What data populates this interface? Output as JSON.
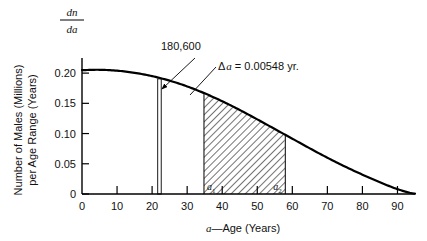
{
  "figure": {
    "background_color": "#ffffff",
    "line_color": "#000000"
  },
  "chart_data": {
    "type": "line",
    "title": "",
    "subtitle": "",
    "xlabel": "a—Age (Years)",
    "ylabel": "Number of Males (Millions) per Age Range (Years)",
    "y_axis_symbol_numerator": "dn",
    "y_axis_symbol_denominator": "da",
    "xlim": [
      0,
      95
    ],
    "ylim": [
      0,
      0.225
    ],
    "xticks": [
      0,
      10,
      20,
      30,
      40,
      50,
      60,
      70,
      80,
      90
    ],
    "xticklabels": [
      "0",
      "10",
      "20",
      "30",
      "40",
      "50",
      "60",
      "70",
      "80",
      "90"
    ],
    "yticks": [
      0,
      0.05,
      0.1,
      0.15,
      0.2
    ],
    "yticklabels": [
      "0",
      "0.05",
      "0.10",
      "0.15",
      "0.20"
    ],
    "grid": false,
    "legend": false,
    "series": [
      {
        "name": "dn/da",
        "x": [
          0,
          5,
          10,
          15,
          20,
          25,
          30,
          35,
          40,
          45,
          50,
          55,
          60,
          65,
          70,
          75,
          80,
          85,
          90,
          95
        ],
        "values": [
          0.205,
          0.2055,
          0.204,
          0.2005,
          0.195,
          0.1875,
          0.178,
          0.1665,
          0.1535,
          0.139,
          0.1235,
          0.1075,
          0.0915,
          0.0755,
          0.06,
          0.0455,
          0.032,
          0.0195,
          0.008,
          0.0005
        ]
      }
    ],
    "annotations": [
      {
        "name": "population-count",
        "text": "180,600",
        "x_data": 22,
        "note": "label for the narrow vertical strip"
      },
      {
        "name": "delta-a",
        "text_delta": "Δ",
        "text_var": "a",
        "text_rest": "= 0.00548 yr.",
        "full_text": "Δa = 0.00548 yr."
      }
    ],
    "narrow_strip": {
      "name": "delta-a-strip",
      "x_start": 21.6,
      "x_end": 22.6,
      "top_value": 0.1905
    },
    "shaded_region": {
      "name": "hatched-age-band",
      "hatch": "diagonal",
      "x_start": 34.8,
      "x_end": 58.0,
      "label_left": "a",
      "label_left_sub": "1",
      "label_right": "a",
      "label_right_sub": "2"
    }
  }
}
